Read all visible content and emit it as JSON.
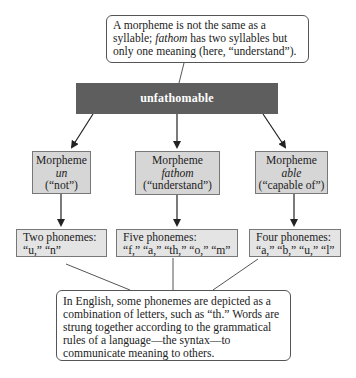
{
  "top_callout": {
    "text_before": "A morpheme is not the same as a syllable; ",
    "italic_word": "fathom",
    "text_after": " has two syllables but only one meaning (here, “understand”)."
  },
  "root": {
    "label": "unfathomable",
    "color": "#5e5e5e"
  },
  "morphemes": [
    {
      "title": "Morpheme",
      "word": "un",
      "meaning": "(“not”)"
    },
    {
      "title": "Morpheme",
      "word": "fathom",
      "meaning": "(“understand”)"
    },
    {
      "title": "Morpheme",
      "word": "able",
      "meaning": "(“capable of”)"
    }
  ],
  "phonemes": [
    {
      "title": "Two phonemes:",
      "list": "“u,” “n”"
    },
    {
      "title": "Five phonemes:",
      "list": "“f,” “a,” “th,” “o,” “m”"
    },
    {
      "title": "Four phonemes:",
      "list": "“a,” “b,” “u,” “l”"
    }
  ],
  "bottom_callout": {
    "text": "In English, some phonemes are depicted as a combination of letters, such as “th.” Words are strung together according to the grammatical rules of a language—the syntax—to communicate meaning to others."
  },
  "colors": {
    "morpheme_fill": "#d6d6d6",
    "phoneme_fill": "#e4e4e4",
    "border": "#777777"
  }
}
